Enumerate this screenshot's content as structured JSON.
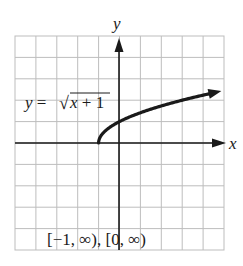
{
  "chart_data": {
    "type": "line",
    "title": "",
    "xlabel": "x",
    "ylabel": "y",
    "grid": true,
    "xlim": [
      -5,
      5
    ],
    "ylim": [
      -5,
      5
    ],
    "series": [
      {
        "name": "y = √(x + 1)",
        "x": [
          -1,
          -0.75,
          -0.5,
          0,
          1,
          2,
          3,
          4,
          5
        ],
        "y": [
          0,
          0.5,
          0.707,
          1,
          1.414,
          1.732,
          2,
          2.236,
          2.449
        ]
      }
    ],
    "annotations": {
      "equation": "y = √x + 1",
      "equation_prefix": "y = ",
      "equation_radicand": "x + 1",
      "domain_range": "[−1, ∞), [0, ∞)"
    },
    "colors": {
      "curve": "#1a1a1a",
      "axes": "#1a1a1a",
      "grid": "#bdbdbd"
    }
  }
}
